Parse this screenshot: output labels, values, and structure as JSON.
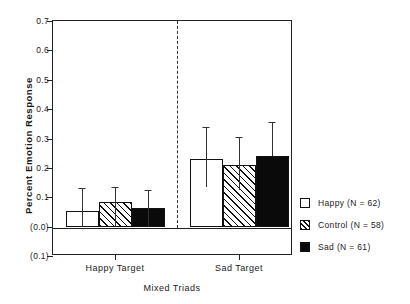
{
  "chart_data": {
    "type": "bar",
    "title": "",
    "xlabel": "Mixed Triads",
    "ylabel": "Percent Emotion Response",
    "categories": [
      "Happy Target",
      "Sad Target"
    ],
    "ylim": [
      -0.1,
      0.7
    ],
    "ytick_values": [
      0.7,
      0.6,
      0.5,
      0.4,
      0.3,
      0.2,
      0.1,
      0.0,
      -0.1
    ],
    "ytick_labels": [
      "0.7",
      "0.6",
      "0.5",
      "0.4",
      "0.3",
      "0.2",
      "0.1",
      "(0.0)",
      "(0.1)"
    ],
    "grid": false,
    "legend_position": "right",
    "series": [
      {
        "name": "Happy (N = 62)",
        "short_name": "Happy",
        "n": 62,
        "fill": "open",
        "values": [
          0.053,
          0.23
        ],
        "err_low": [
          0.053,
          0.095
        ],
        "err_high": [
          0.077,
          0.11
        ]
      },
      {
        "name": "Control (N = 58)",
        "short_name": "Control",
        "n": 58,
        "fill": "hatch",
        "values": [
          0.085,
          0.21
        ],
        "err_low": [
          0.085,
          0.085
        ],
        "err_high": [
          0.05,
          0.095
        ]
      },
      {
        "name": "Sad (N = 61)",
        "short_name": "Sad",
        "n": 61,
        "fill": "solid",
        "values": [
          0.065,
          0.24
        ],
        "err_low": [
          0.065,
          0.0
        ],
        "err_high": [
          0.06,
          0.115
        ]
      }
    ]
  },
  "axis": {
    "y_title": "Percent Emotion Response",
    "x_title": "Mixed Triads",
    "ticks_y": [
      "0.7",
      "0.6",
      "0.5",
      "0.4",
      "0.3",
      "0.2",
      "0.1",
      "(0.0)",
      "(0.1)"
    ],
    "ticks_x": [
      "Happy Target",
      "Sad Target"
    ]
  },
  "legend": {
    "entries": [
      {
        "label": "Happy (N = 62)",
        "fill": "open"
      },
      {
        "label": "Control (N = 58)",
        "fill": "hatch"
      },
      {
        "label": "Sad (N = 61)",
        "fill": "solid"
      }
    ]
  },
  "colors": {
    "axis": "#222222",
    "bar_outline": "#111111",
    "bar_solid": "#0a0a0a",
    "bar_open": "#ffffff",
    "background": "#ffffff"
  }
}
